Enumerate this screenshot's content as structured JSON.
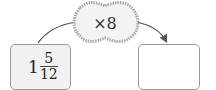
{
  "operator": {
    "symbol": "×",
    "value": "8"
  },
  "input": {
    "whole": "1",
    "numerator": "5",
    "denominator": "12"
  },
  "output": {
    "value": ""
  },
  "colors": {
    "border": "#9a9a9a",
    "input_fill": "#f1f1f1",
    "cloud_fill": "#f3f3f3",
    "cloud_border": "#a8a8a8",
    "arrow": "#555555"
  }
}
